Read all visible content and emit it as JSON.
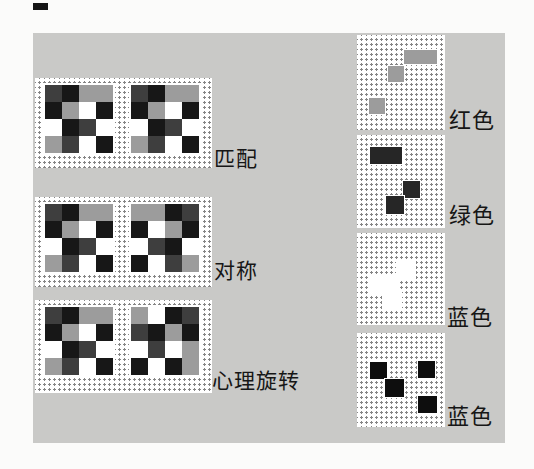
{
  "figure": {
    "description_colors": {
      "page_background": "#fbfbfa",
      "figure_background": "#c9c9c7",
      "dot_color": "#858585"
    }
  },
  "palette": {
    "black": "#171717",
    "dark": "#3e3e3e",
    "gray": "#9c9c9c",
    "white": "#ffffff"
  },
  "left_rows": [
    {
      "label": "匹配",
      "grids": [
        [
          [
            "dark",
            "black",
            "gray",
            "gray"
          ],
          [
            "black",
            "gray",
            "white",
            "black"
          ],
          [
            "white",
            "black",
            "dark",
            "white"
          ],
          [
            "gray",
            "dark",
            "white",
            "black"
          ]
        ],
        [
          [
            "dark",
            "black",
            "gray",
            "gray"
          ],
          [
            "black",
            "gray",
            "white",
            "black"
          ],
          [
            "white",
            "black",
            "dark",
            "white"
          ],
          [
            "gray",
            "dark",
            "white",
            "black"
          ]
        ]
      ]
    },
    {
      "label": "对称",
      "grids": [
        [
          [
            "dark",
            "black",
            "gray",
            "gray"
          ],
          [
            "black",
            "gray",
            "white",
            "black"
          ],
          [
            "white",
            "black",
            "dark",
            "white"
          ],
          [
            "gray",
            "dark",
            "white",
            "black"
          ]
        ],
        [
          [
            "gray",
            "gray",
            "black",
            "dark"
          ],
          [
            "black",
            "white",
            "gray",
            "black"
          ],
          [
            "white",
            "dark",
            "black",
            "white"
          ],
          [
            "black",
            "white",
            "dark",
            "gray"
          ]
        ]
      ]
    },
    {
      "label": "心理旋转",
      "grids": [
        [
          [
            "dark",
            "black",
            "gray",
            "gray"
          ],
          [
            "black",
            "gray",
            "white",
            "black"
          ],
          [
            "white",
            "black",
            "dark",
            "white"
          ],
          [
            "gray",
            "dark",
            "white",
            "black"
          ]
        ],
        [
          [
            "gray",
            "white",
            "black",
            "dark"
          ],
          [
            "dark",
            "black",
            "gray",
            "black"
          ],
          [
            "white",
            "dark",
            "white",
            "gray"
          ],
          [
            "black",
            "white",
            "black",
            "gray"
          ]
        ]
      ]
    }
  ],
  "right_panels": [
    {
      "label": "红色",
      "color": "#9c9c9c",
      "shapes": [
        {
          "x": 47,
          "y": 15,
          "w": 33,
          "h": 14
        },
        {
          "x": 31,
          "y": 31,
          "w": 16,
          "h": 16
        },
        {
          "x": 12,
          "y": 63,
          "w": 16,
          "h": 16
        }
      ]
    },
    {
      "label": "绿色",
      "color": "#262626",
      "shapes": [
        {
          "x": 13,
          "y": 12,
          "w": 32,
          "h": 17
        },
        {
          "x": 46,
          "y": 46,
          "w": 17,
          "h": 17
        },
        {
          "x": 29,
          "y": 61,
          "w": 18,
          "h": 18
        }
      ]
    },
    {
      "label": "蓝色",
      "color": "#ffffff",
      "shapes": [
        {
          "x": 40,
          "y": 29,
          "w": 18,
          "h": 18
        },
        {
          "x": 13,
          "y": 44,
          "w": 27,
          "h": 18
        },
        {
          "x": 26,
          "y": 58,
          "w": 18,
          "h": 17
        }
      ]
    },
    {
      "label": "蓝色",
      "color": "#0e0e0e",
      "shapes": [
        {
          "x": 13,
          "y": 29,
          "w": 17,
          "h": 17
        },
        {
          "x": 61,
          "y": 28,
          "w": 17,
          "h": 17
        },
        {
          "x": 28,
          "y": 46,
          "w": 19,
          "h": 18
        },
        {
          "x": 61,
          "y": 63,
          "w": 19,
          "h": 17
        }
      ]
    }
  ]
}
